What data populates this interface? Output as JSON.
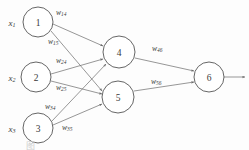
{
  "figure": {
    "title": "",
    "caption": "图",
    "output_arrow": "output-arrow"
  },
  "nodes": [
    {
      "id": "1",
      "label": "1",
      "input_label": "x",
      "input_sub": "1",
      "cx": 38,
      "cy": 22,
      "r": 15
    },
    {
      "id": "2",
      "label": "2",
      "input_label": "x",
      "input_sub": "2",
      "cx": 36,
      "cy": 77,
      "r": 15
    },
    {
      "id": "3",
      "label": "3",
      "input_label": "x",
      "input_sub": "3",
      "cx": 38,
      "cy": 128,
      "r": 15
    },
    {
      "id": "4",
      "label": "4",
      "input_label": "",
      "input_sub": "",
      "cx": 119,
      "cy": 52,
      "r": 16
    },
    {
      "id": "5",
      "label": "5",
      "input_label": "",
      "input_sub": "",
      "cx": 118,
      "cy": 97,
      "r": 16
    },
    {
      "id": "6",
      "label": "6",
      "input_label": "",
      "input_sub": "",
      "cx": 209,
      "cy": 77,
      "r": 15
    }
  ],
  "weights": [
    {
      "id": "w14",
      "base": "w",
      "sub": "14",
      "from": "1",
      "to": "4",
      "x": 56,
      "y": 12
    },
    {
      "id": "w15",
      "base": "w",
      "sub": "15",
      "from": "1",
      "to": "5",
      "x": 49,
      "y": 41
    },
    {
      "id": "w24",
      "base": "w",
      "sub": "24",
      "from": "2",
      "to": "4",
      "x": 56,
      "y": 60
    },
    {
      "id": "w25",
      "base": "w",
      "sub": "25",
      "from": "2",
      "to": "5",
      "x": 56,
      "y": 87
    },
    {
      "id": "w34",
      "base": "w",
      "sub": "34",
      "from": "3",
      "to": "4",
      "x": 46,
      "y": 106
    },
    {
      "id": "w35",
      "base": "w",
      "sub": "35",
      "from": "3",
      "to": "5",
      "x": 62,
      "y": 127
    },
    {
      "id": "w46",
      "base": "w",
      "sub": "46",
      "from": "4",
      "to": "6",
      "x": 153,
      "y": 48
    },
    {
      "id": "w56",
      "base": "w",
      "sub": "56",
      "from": "5",
      "to": "6",
      "x": 152,
      "y": 81
    }
  ],
  "edges": [
    {
      "id": "edge-1-4",
      "x1": 53,
      "y1": 24,
      "x2": 103,
      "y2": 46
    },
    {
      "id": "edge-1-5",
      "x1": 51,
      "y1": 30,
      "x2": 103,
      "y2": 92
    },
    {
      "id": "edge-2-4",
      "x1": 51,
      "y1": 74,
      "x2": 103,
      "y2": 58
    },
    {
      "id": "edge-2-5",
      "x1": 51,
      "y1": 80,
      "x2": 103,
      "y2": 93
    },
    {
      "id": "edge-3-4",
      "x1": 52,
      "y1": 122,
      "x2": 105,
      "y2": 62
    },
    {
      "id": "edge-3-5",
      "x1": 53,
      "y1": 126,
      "x2": 103,
      "y2": 102
    },
    {
      "id": "edge-4-6",
      "x1": 135,
      "y1": 57,
      "x2": 194,
      "y2": 72
    },
    {
      "id": "edge-5-6",
      "x1": 134,
      "y1": 91,
      "x2": 194,
      "y2": 81
    },
    {
      "id": "edge-out",
      "x1": 224,
      "y1": 77,
      "x2": 246,
      "y2": 77
    }
  ],
  "layers": {
    "input_label": "input-layer",
    "hidden_label": "hidden-layer",
    "output_label": "output-layer"
  }
}
